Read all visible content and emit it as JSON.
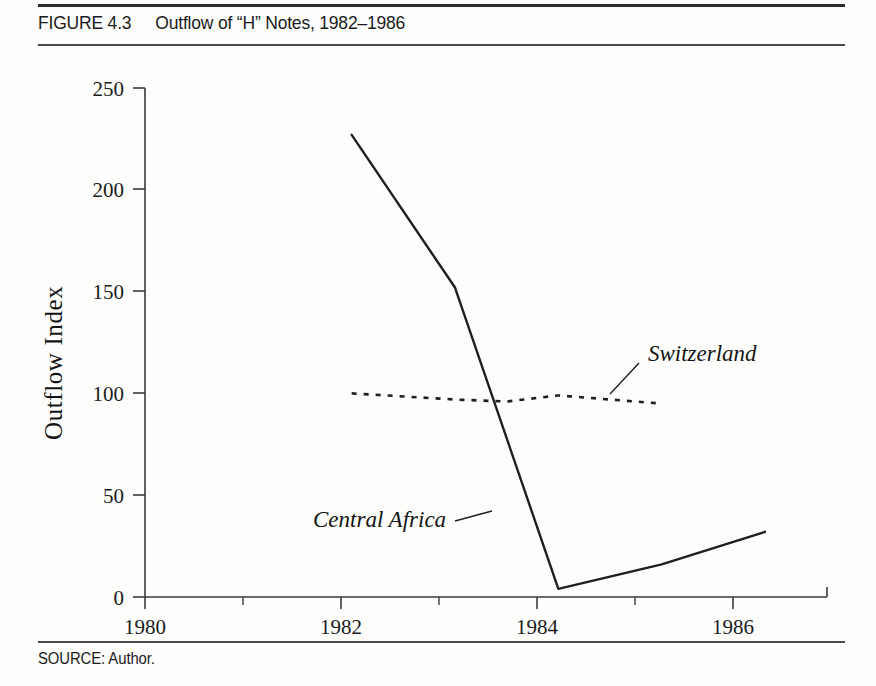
{
  "figure": {
    "number_label": "FIGURE 4.3",
    "title": "Outflow of “H” Notes, 1982–1986",
    "source": "SOURCE: Author."
  },
  "chart_data": {
    "type": "line",
    "title": "Outflow of “H” Notes, 1982–1986",
    "xlabel": "",
    "ylabel": "Outflow Index",
    "xlim": [
      1980,
      1986.6
    ],
    "ylim": [
      0,
      250
    ],
    "grid": false,
    "legend_position": "inline-annotation",
    "x_ticks": [
      1980,
      1982,
      1984,
      1986
    ],
    "x_tick_labels": [
      "1980",
      "1982",
      "1984",
      "1986"
    ],
    "x_minor_ticks": [
      1981,
      1983,
      1985
    ],
    "y_ticks": [
      0,
      50,
      100,
      150,
      200,
      250
    ],
    "y_tick_labels": [
      "0",
      "50",
      "100",
      "150",
      "200",
      "250"
    ],
    "series": [
      {
        "name": "Central  Africa",
        "style": "solid",
        "color": "#1f1f1f",
        "x": [
          1982,
          1983,
          1984,
          1985,
          1986
        ],
        "values": [
          227,
          152,
          4,
          16,
          32
        ]
      },
      {
        "name": "Switzerland",
        "style": "dotted",
        "color": "#1f1f1f",
        "x": [
          1982,
          1983,
          1983.5,
          1984,
          1985
        ],
        "values": [
          100,
          97,
          96,
          99,
          95
        ]
      }
    ],
    "annotations": [
      {
        "text": "Switzerland",
        "x": 1984.6,
        "y": 118
      },
      {
        "text": "Central  Africa",
        "x": 1982.45,
        "y": 47
      }
    ]
  }
}
